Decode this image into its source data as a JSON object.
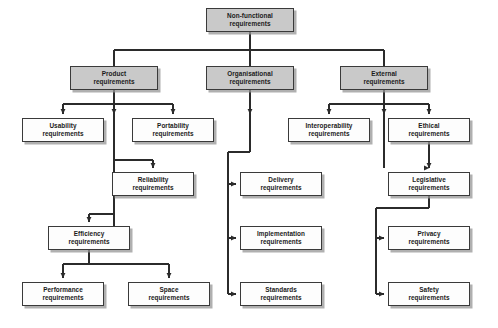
{
  "diagram": {
    "style": {
      "fill_level1": "#c9c9c9",
      "fill_leaf": "#fdfdfd",
      "stroke": "#3a3a3a",
      "shadow": "#969696",
      "background": "#ffffff"
    },
    "nodes": [
      {
        "id": "nonfunctional",
        "line1": "Non-functional",
        "line2": "requirements",
        "style": "gray",
        "x": 206,
        "y": 8,
        "w": 88,
        "h": 24
      },
      {
        "id": "product",
        "line1": "Product",
        "line2": "requirements",
        "style": "gray",
        "x": 70,
        "y": 66,
        "w": 88,
        "h": 24
      },
      {
        "id": "organisational",
        "line1": "Organisational",
        "line2": "requirements",
        "style": "gray",
        "x": 206,
        "y": 66,
        "w": 88,
        "h": 24
      },
      {
        "id": "external",
        "line1": "External",
        "line2": "requirements",
        "style": "gray",
        "x": 340,
        "y": 66,
        "w": 88,
        "h": 24
      },
      {
        "id": "usability",
        "line1": "Usability",
        "line2": "requirements",
        "style": "white",
        "x": 22,
        "y": 118,
        "w": 82,
        "h": 24
      },
      {
        "id": "portability",
        "line1": "Portability",
        "line2": "requirements",
        "style": "white",
        "x": 132,
        "y": 118,
        "w": 82,
        "h": 24
      },
      {
        "id": "interoperability",
        "line1": "Interoperability",
        "line2": "requirements",
        "style": "white",
        "x": 288,
        "y": 118,
        "w": 82,
        "h": 24
      },
      {
        "id": "ethical",
        "line1": "Ethical",
        "line2": "requirements",
        "style": "white",
        "x": 388,
        "y": 118,
        "w": 82,
        "h": 24
      },
      {
        "id": "reliability",
        "line1": "Reliability",
        "line2": "requirements",
        "style": "white",
        "x": 112,
        "y": 172,
        "w": 82,
        "h": 24
      },
      {
        "id": "delivery",
        "line1": "Delivery",
        "line2": "requirements",
        "style": "white",
        "x": 240,
        "y": 172,
        "w": 82,
        "h": 24
      },
      {
        "id": "legislative",
        "line1": "Legislative",
        "line2": "requirements",
        "style": "white",
        "x": 388,
        "y": 172,
        "w": 82,
        "h": 24
      },
      {
        "id": "efficiency",
        "line1": "Efficiency",
        "line2": "requirements",
        "style": "white",
        "x": 48,
        "y": 226,
        "w": 82,
        "h": 24
      },
      {
        "id": "implementation",
        "line1": "Implementation",
        "line2": "requirements",
        "style": "white",
        "x": 240,
        "y": 226,
        "w": 82,
        "h": 24
      },
      {
        "id": "privacy",
        "line1": "Privacy",
        "line2": "requirements",
        "style": "white",
        "x": 388,
        "y": 226,
        "w": 82,
        "h": 24
      },
      {
        "id": "performance",
        "line1": "Performance",
        "line2": "requirements",
        "style": "white",
        "x": 22,
        "y": 282,
        "w": 82,
        "h": 24
      },
      {
        "id": "space",
        "line1": "Space",
        "line2": "requirements",
        "style": "white",
        "x": 128,
        "y": 282,
        "w": 82,
        "h": 24
      },
      {
        "id": "standards",
        "line1": "Standards",
        "line2": "requirements",
        "style": "white",
        "x": 240,
        "y": 282,
        "w": 82,
        "h": 24
      },
      {
        "id": "safety",
        "line1": "Safety",
        "line2": "requirements",
        "style": "white",
        "x": 388,
        "y": 282,
        "w": 82,
        "h": 24
      }
    ],
    "edges": [
      {
        "from": "nonfunctional",
        "to": "product",
        "entry": "top"
      },
      {
        "from": "nonfunctional",
        "to": "organisational",
        "entry": "top"
      },
      {
        "from": "nonfunctional",
        "to": "external",
        "entry": "top"
      },
      {
        "from": "product",
        "to": "usability",
        "entry": "top"
      },
      {
        "from": "product",
        "to": "portability",
        "entry": "top"
      },
      {
        "from": "product",
        "to": "reliability",
        "entry": "top"
      },
      {
        "from": "product",
        "to": "efficiency",
        "entry": "top"
      },
      {
        "from": "external",
        "to": "interoperability",
        "entry": "top"
      },
      {
        "from": "external",
        "to": "ethical",
        "entry": "top"
      },
      {
        "from": "external",
        "to": "legislative",
        "entry": "top"
      },
      {
        "from": "organisational",
        "to": "delivery",
        "entry": "left"
      },
      {
        "from": "organisational",
        "to": "implementation",
        "entry": "left"
      },
      {
        "from": "organisational",
        "to": "standards",
        "entry": "left"
      },
      {
        "from": "legislative",
        "to": "privacy",
        "entry": "left"
      },
      {
        "from": "legislative",
        "to": "safety",
        "entry": "left"
      }
    ]
  }
}
